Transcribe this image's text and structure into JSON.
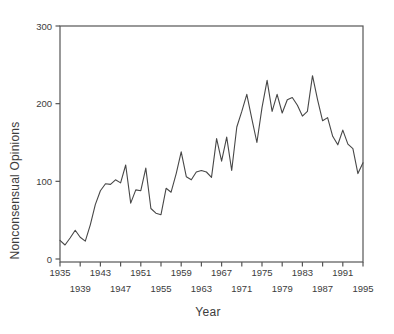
{
  "chart_data": {
    "type": "line",
    "title": "",
    "xlabel": "Year",
    "ylabel": "Nonconsensual Opinions",
    "xlim": [
      1935,
      1995
    ],
    "ylim": [
      0,
      300
    ],
    "grid": false,
    "legend": "none",
    "frame": "full-box",
    "x": [
      1935,
      1936,
      1937,
      1938,
      1939,
      1940,
      1941,
      1942,
      1943,
      1944,
      1945,
      1946,
      1947,
      1948,
      1949,
      1950,
      1951,
      1952,
      1953,
      1954,
      1955,
      1956,
      1957,
      1958,
      1959,
      1960,
      1961,
      1962,
      1963,
      1964,
      1965,
      1966,
      1967,
      1968,
      1969,
      1970,
      1971,
      1972,
      1973,
      1974,
      1975,
      1976,
      1977,
      1978,
      1979,
      1980,
      1981,
      1982,
      1983,
      1984,
      1985,
      1986,
      1987,
      1988,
      1989,
      1990,
      1991,
      1992,
      1993,
      1994,
      1995
    ],
    "values": [
      24,
      18,
      27,
      37,
      28,
      23,
      44,
      70,
      88,
      97,
      96,
      102,
      98,
      121,
      72,
      89,
      88,
      117,
      65,
      59,
      57,
      91,
      86,
      110,
      138,
      106,
      102,
      112,
      114,
      112,
      105,
      155,
      126,
      157,
      114,
      170,
      190,
      212,
      180,
      150,
      195,
      230,
      190,
      212,
      188,
      205,
      208,
      198,
      184,
      190,
      236,
      205,
      178,
      182,
      158,
      147,
      166,
      148,
      142,
      110,
      124
    ],
    "yticks": [
      0,
      100,
      200,
      300
    ],
    "ytick_labels": [
      "0",
      "100",
      "200",
      "300"
    ],
    "xtick_interval_years": 4,
    "xtick_labels_row1": [
      "1935",
      "1943",
      "1951",
      "1959",
      "1967",
      "1975",
      "1983",
      "1991"
    ],
    "xtick_labels_row2": [
      "1939",
      "1947",
      "1955",
      "1963",
      "1971",
      "1979",
      "1987",
      "1995"
    ],
    "line_color": "#474747",
    "frame_color": "#555555",
    "text_color": "#3c3c3c"
  }
}
